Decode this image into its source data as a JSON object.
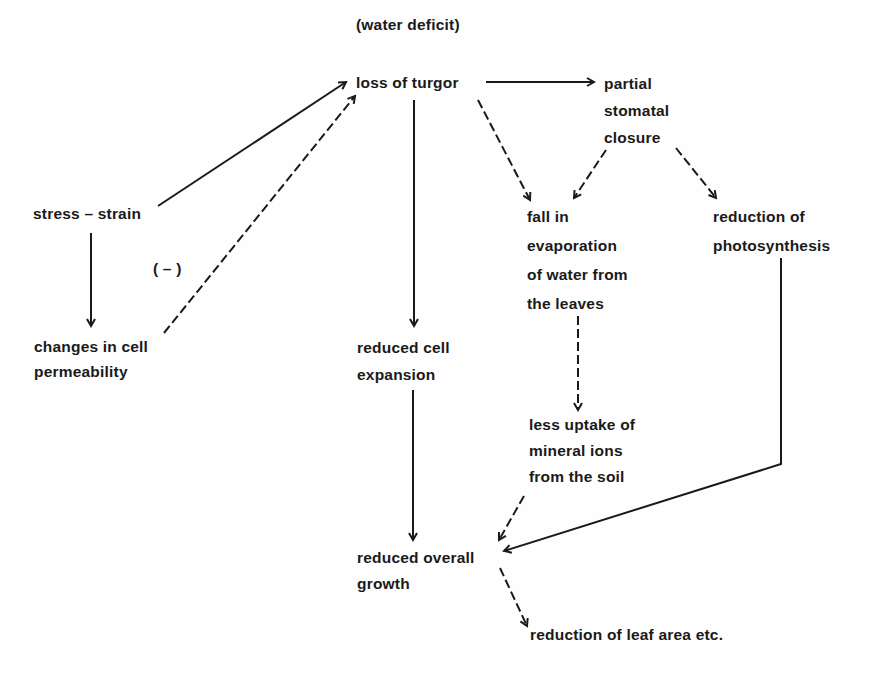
{
  "diagram": {
    "title": "(water deficit)",
    "nodes": {
      "loss_of_turgor": {
        "lines": [
          "loss of turgor"
        ]
      },
      "partial_stomatal_closure": {
        "lines": [
          "partial",
          "stomatal",
          "closure"
        ]
      },
      "stress_strain": {
        "lines": [
          "stress – strain"
        ]
      },
      "negative_label": {
        "lines": [
          "( – )"
        ]
      },
      "changes_in_cell_permeability": {
        "lines": [
          "changes in cell",
          "permeability"
        ]
      },
      "fall_in_evaporation": {
        "lines": [
          "fall in",
          "evaporation",
          "of water from",
          "the leaves"
        ]
      },
      "reduction_of_photosynthesis": {
        "lines": [
          "reduction of",
          "photosynthesis"
        ]
      },
      "reduced_cell_expansion": {
        "lines": [
          "reduced cell",
          "expansion"
        ]
      },
      "less_uptake_of_mineral_ions": {
        "lines": [
          "less uptake of",
          "mineral ions",
          "from the soil"
        ]
      },
      "reduced_overall_growth": {
        "lines": [
          "reduced overall",
          "growth"
        ]
      },
      "reduction_of_leaf_area": {
        "lines": [
          "reduction of leaf area etc."
        ]
      }
    },
    "edges": [
      {
        "from": "loss_of_turgor",
        "to": "partial_stomatal_closure",
        "style": "solid"
      },
      {
        "from": "stress_strain",
        "to": "loss_of_turgor",
        "style": "solid"
      },
      {
        "from": "changes_in_cell_permeability",
        "to": "loss_of_turgor",
        "style": "dashed",
        "label": "( – )"
      },
      {
        "from": "stress_strain",
        "to": "changes_in_cell_permeability",
        "style": "solid"
      },
      {
        "from": "loss_of_turgor",
        "to": "reduced_cell_expansion",
        "style": "solid"
      },
      {
        "from": "loss_of_turgor",
        "to": "fall_in_evaporation",
        "style": "dashed"
      },
      {
        "from": "partial_stomatal_closure",
        "to": "fall_in_evaporation",
        "style": "dashed"
      },
      {
        "from": "partial_stomatal_closure",
        "to": "reduction_of_photosynthesis",
        "style": "dashed"
      },
      {
        "from": "fall_in_evaporation",
        "to": "less_uptake_of_mineral_ions",
        "style": "dashed"
      },
      {
        "from": "reduced_cell_expansion",
        "to": "reduced_overall_growth",
        "style": "solid"
      },
      {
        "from": "less_uptake_of_mineral_ions",
        "to": "reduced_overall_growth",
        "style": "dashed"
      },
      {
        "from": "reduction_of_photosynthesis",
        "to": "reduced_overall_growth",
        "style": "solid"
      },
      {
        "from": "reduced_overall_growth",
        "to": "reduction_of_leaf_area",
        "style": "dashed"
      }
    ],
    "colors": {
      "ink": "#1a1a1a",
      "background": "#fefefe"
    }
  }
}
